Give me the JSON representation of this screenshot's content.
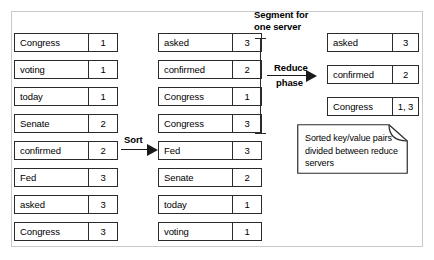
{
  "diagram": {
    "colors": {
      "box_border": "#2b2b2b",
      "frame_border": "#c9c9c9",
      "arrow": "#1a1a1a",
      "background": "#ffffff"
    }
  },
  "columns": {
    "unsorted": {
      "name": "unsorted-pairs",
      "pairs": [
        {
          "key": "Congress",
          "value": "1"
        },
        {
          "key": "voting",
          "value": "1"
        },
        {
          "key": "today",
          "value": "1"
        },
        {
          "key": "Senate",
          "value": "2"
        },
        {
          "key": "confirmed",
          "value": "2"
        },
        {
          "key": "Fed",
          "value": "3"
        },
        {
          "key": "asked",
          "value": "3"
        },
        {
          "key": "Congress",
          "value": "3"
        }
      ]
    },
    "sorted": {
      "name": "sorted-pairs",
      "pairs": [
        {
          "key": "asked",
          "value": "3"
        },
        {
          "key": "confirmed",
          "value": "2"
        },
        {
          "key": "Congress",
          "value": "1"
        },
        {
          "key": "Congress",
          "value": "3"
        },
        {
          "key": "Fed",
          "value": "3"
        },
        {
          "key": "Senate",
          "value": "2"
        },
        {
          "key": "today",
          "value": "1"
        },
        {
          "key": "voting",
          "value": "1"
        }
      ]
    },
    "reduced": {
      "name": "reduced-pairs",
      "pairs": [
        {
          "key": "asked",
          "value": "3"
        },
        {
          "key": "confirmed",
          "value": "2"
        },
        {
          "key": "Congress",
          "value": "1, 3"
        }
      ]
    }
  },
  "arrows": {
    "sort": {
      "label": "Sort"
    },
    "reduce": {
      "label_line1": "Reduce",
      "label_line2": "phase"
    }
  },
  "bracket": {
    "caption_line1": "Segment for",
    "caption_line2": "one server"
  },
  "note": {
    "text": "Sorted key/value pairs divided between reduce servers"
  }
}
